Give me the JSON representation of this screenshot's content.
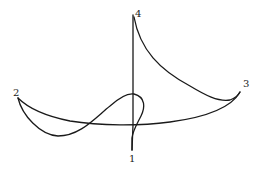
{
  "diagram": {
    "type": "space-curve-sketch",
    "stroke_color": "#1a1a1a",
    "background": "#ffffff",
    "points": [
      {
        "id": "1",
        "label": "1",
        "x": 132,
        "y": 150,
        "label_x": 129,
        "label_y": 161
      },
      {
        "id": "2",
        "label": "2",
        "x": 18,
        "y": 98,
        "label_x": 12,
        "label_y": 96
      },
      {
        "id": "3",
        "label": "3",
        "x": 240,
        "y": 92,
        "label_x": 243,
        "label_y": 87
      },
      {
        "id": "4",
        "label": "4",
        "x": 133,
        "y": 15,
        "label_x": 135,
        "label_y": 17
      }
    ],
    "segments": [
      {
        "name": "vertical-4-to-1",
        "from": "4",
        "to": "1"
      },
      {
        "name": "arc-4-to-3",
        "from": "4",
        "to": "3"
      },
      {
        "name": "arc-3-to-2-lower",
        "from": "3",
        "to": "2"
      },
      {
        "name": "loop-2-through-center-to-1",
        "from": "2",
        "to": "1"
      }
    ]
  }
}
